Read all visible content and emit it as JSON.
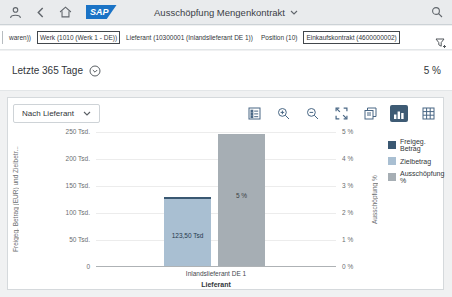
{
  "shell": {
    "title": "Ausschöpfung Mengenkontrakt"
  },
  "filter_bar": {
    "truncated_text": "waren))",
    "items": [
      {
        "label": "Werk (1010 (Werk 1 - DE))",
        "highlighted": true
      },
      {
        "label": "Lieferant (10300001 (Inlandslieferant DE 1))",
        "highlighted": false
      },
      {
        "label": "Position (10)",
        "highlighted": false
      },
      {
        "label": "Einkaufskontrakt (4600000002)",
        "highlighted": true
      }
    ]
  },
  "kpi_bar": {
    "period": "Letzte 365 Tage",
    "value": "5 %"
  },
  "chart_toolbar": {
    "dimension_selector": "Nach Lieferant",
    "selected_view": "bar-chart"
  },
  "icons": {
    "shell": [
      "person-icon",
      "back-icon",
      "home-icon",
      "search-icon",
      "chevron-down-icon"
    ],
    "filter_bar": [
      "filter-add-icon"
    ],
    "kpi_bar": [
      "circled-chevron-down-icon"
    ],
    "toolbar": [
      "legend-toggle-icon",
      "zoom-in-icon",
      "zoom-out-icon",
      "fullscreen-icon",
      "copy-icon",
      "bar-chart-icon",
      "table-icon"
    ]
  },
  "chart_data": {
    "type": "bar",
    "categories": [
      "Inlandslieferant DE 1"
    ],
    "series": [
      {
        "name": "Freigeg. Betrag",
        "axis": "left",
        "values_tsd_eur": [
          127
        ],
        "color": "#3a5872",
        "rendering_note": "visible only as thin dark cap above Zielbetrag column"
      },
      {
        "name": "Zielbetrag",
        "axis": "left",
        "values_tsd_eur": [
          123.5
        ],
        "data_labels": [
          "123,50 Tsd"
        ],
        "color": "#a9bfd2"
      },
      {
        "name": "Ausschöpfung %",
        "axis": "right",
        "values_pct": [
          5
        ],
        "data_labels": [
          "5 %"
        ],
        "color": "#a6aeb4"
      }
    ],
    "left_axis": {
      "title": "Freigeg. Betrag (EUR) und Zielbetr...",
      "range_tsd": [
        0,
        250
      ],
      "ticks": [
        "250 Tsd.",
        "200 Tsd.",
        "150 Tsd.",
        "100 Tsd.",
        "50 Tsd.",
        "0"
      ]
    },
    "right_axis": {
      "title": "Ausschöpfung %",
      "range_pct": [
        0,
        5
      ],
      "ticks": [
        "5 %",
        "4 %",
        "3 %",
        "2 %",
        "1 %",
        "0 %"
      ]
    },
    "x_axis": {
      "title": "Lieferant"
    },
    "grid": true,
    "legend_position": "right"
  }
}
